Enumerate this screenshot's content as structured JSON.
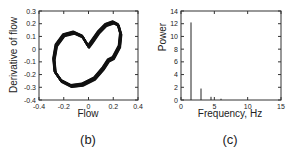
{
  "chart_data": [
    {
      "type": "scatter",
      "panel_label": "(b)",
      "title": "",
      "xlabel": "Flow",
      "ylabel": "Derivative of flow",
      "xlim": [
        -0.4,
        0.4
      ],
      "ylim": [
        -0.4,
        0.3
      ],
      "xticks": [
        "-0.4",
        "-0.2",
        "0",
        "0.2",
        "0.4"
      ],
      "yticks": [
        "-0.4",
        "-0.3",
        "-0.2",
        "-0.1",
        "0",
        "0.1",
        "0.2",
        "0.3"
      ],
      "grid": false,
      "description": "Phase-space loop (heart-shaped closed trajectory, many overlapping cycles)",
      "series": [
        {
          "name": "trajectory",
          "x": [
            0.0,
            -0.05,
            -0.12,
            -0.2,
            -0.26,
            -0.28,
            -0.27,
            -0.22,
            -0.14,
            -0.05,
            0.05,
            0.12,
            0.16,
            0.2,
            0.25,
            0.26,
            0.24,
            0.2,
            0.14,
            0.08,
            0.03,
            0.0
          ],
          "y": [
            0.02,
            0.1,
            0.13,
            0.11,
            0.03,
            -0.08,
            -0.18,
            -0.25,
            -0.29,
            -0.28,
            -0.23,
            -0.15,
            -0.09,
            -0.07,
            0.02,
            0.12,
            0.19,
            0.21,
            0.19,
            0.13,
            0.06,
            0.02
          ]
        }
      ]
    },
    {
      "type": "bar",
      "panel_label": "(c)",
      "title": "",
      "xlabel": "Frequency, Hz",
      "ylabel": "Power",
      "xlim": [
        0,
        15
      ],
      "ylim": [
        0,
        14
      ],
      "xticks": [
        "0",
        "5",
        "10",
        "15"
      ],
      "yticks": [
        "0",
        "2",
        "4",
        "6",
        "8",
        "10",
        "12",
        "14"
      ],
      "grid": false,
      "x": [
        1.5,
        3.0,
        4.5,
        6.0
      ],
      "values": [
        12.2,
        1.8,
        0.5,
        0.2
      ]
    }
  ],
  "panels": {
    "b": {
      "xlabel": "Flow",
      "ylabel": "Derivative of flow",
      "caption": "(b)"
    },
    "c": {
      "xlabel": "Frequency, Hz",
      "ylabel": "Power",
      "caption": "(c)"
    }
  }
}
